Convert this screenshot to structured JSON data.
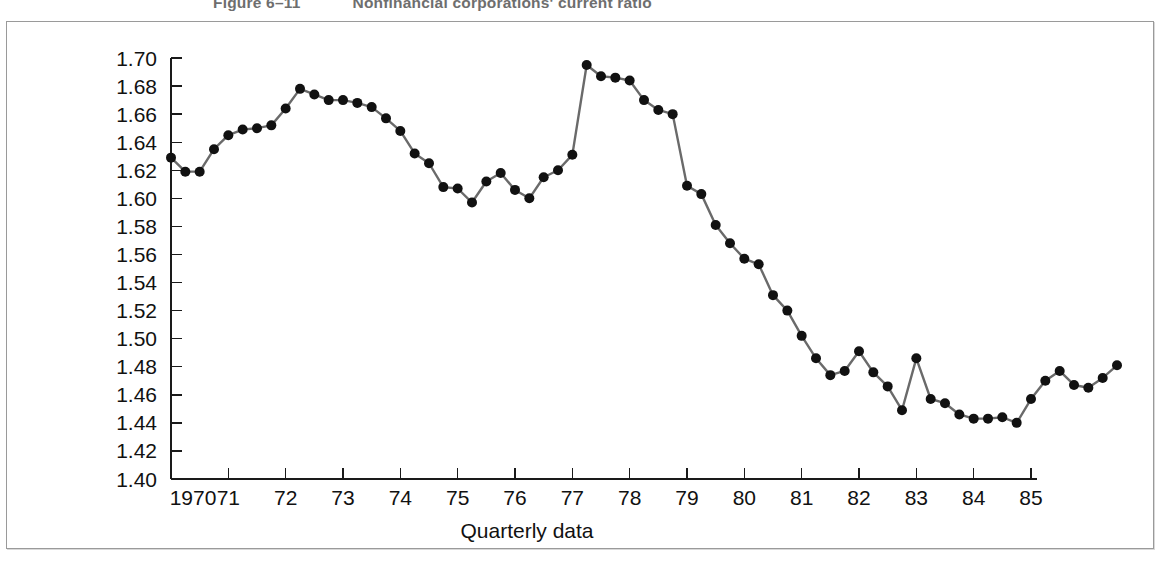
{
  "caption": {
    "figure_number": "Figure 6–11",
    "figure_title": "Nonfinancial corporations' current ratio"
  },
  "axes": {
    "x_axis_title": "Quarterly data",
    "y_axis_title": "",
    "y_ticks": [
      "1.70",
      "1.68",
      "1.66",
      "1.64",
      "1.62",
      "1.60",
      "1.58",
      "1.56",
      "1.54",
      "1.52",
      "1.50",
      "1.48",
      "1.46",
      "1.44",
      "1.42",
      "1.40"
    ],
    "x_ticks": [
      "1970",
      "71",
      "72",
      "73",
      "74",
      "75",
      "76",
      "77",
      "78",
      "79",
      "80",
      "81",
      "82",
      "83",
      "84",
      "85"
    ]
  },
  "colors": {
    "line": "#6a6a6a",
    "marker": "#111111",
    "axis": "#1a1a1a",
    "frame": "#9a9a9a",
    "caption": "#6e6e6e",
    "background": "#ffffff"
  },
  "chart_data": {
    "type": "line",
    "title": "Nonfinancial corporations' current ratio",
    "xlabel": "Quarterly data",
    "ylabel": "",
    "xlim": [
      1970.0,
      1985.5
    ],
    "ylim": [
      1.4,
      1.7
    ],
    "ytick_step": 0.02,
    "grid": false,
    "legend": "none",
    "marker": "filled-circle",
    "categories": [
      "1970.0",
      "1970.25",
      "1970.5",
      "1970.75",
      "1971.0",
      "1971.25",
      "1971.5",
      "1971.75",
      "1972.0",
      "1972.25",
      "1972.5",
      "1972.75",
      "1973.0",
      "1973.25",
      "1973.5",
      "1973.75",
      "1974.0",
      "1974.25",
      "1974.5",
      "1974.75",
      "1975.0",
      "1975.25",
      "1975.5",
      "1975.75",
      "1976.0",
      "1976.25",
      "1976.5",
      "1976.75",
      "1977.0",
      "1977.25",
      "1977.5",
      "1977.75",
      "1978.0",
      "1978.25",
      "1978.5",
      "1978.75",
      "1979.0",
      "1979.25",
      "1979.5",
      "1979.75",
      "1980.0",
      "1980.25",
      "1980.5",
      "1980.75",
      "1981.0",
      "1981.25",
      "1981.5",
      "1981.75",
      "1982.0",
      "1982.25",
      "1982.5",
      "1982.75",
      "1983.0",
      "1983.25",
      "1983.5",
      "1983.75",
      "1984.0",
      "1984.25",
      "1984.5",
      "1984.75",
      "1985.0",
      "1985.25",
      "1985.5"
    ],
    "x": [
      1970.0,
      1970.25,
      1970.5,
      1970.75,
      1971.0,
      1971.25,
      1971.5,
      1971.75,
      1972.0,
      1972.25,
      1972.5,
      1972.75,
      1973.0,
      1973.25,
      1973.5,
      1973.75,
      1974.0,
      1974.25,
      1974.5,
      1974.75,
      1975.0,
      1975.25,
      1975.5,
      1975.75,
      1976.0,
      1976.25,
      1976.5,
      1976.75,
      1977.0,
      1977.25,
      1977.5,
      1977.75,
      1978.0,
      1978.25,
      1978.5,
      1978.75,
      1979.0,
      1979.25,
      1979.5,
      1979.75,
      1980.0,
      1980.25,
      1980.5,
      1980.75,
      1981.0,
      1981.25,
      1981.5,
      1981.75,
      1982.0,
      1982.25,
      1982.5,
      1982.75,
      1983.0,
      1983.25,
      1983.5,
      1983.75,
      1984.0,
      1984.25,
      1984.5,
      1984.75,
      1985.0,
      1985.25,
      1985.5
    ],
    "values": [
      1.629,
      1.619,
      1.619,
      1.635,
      1.645,
      1.649,
      1.65,
      1.652,
      1.664,
      1.678,
      1.674,
      1.67,
      1.67,
      1.668,
      1.665,
      1.657,
      1.648,
      1.632,
      1.625,
      1.608,
      1.607,
      1.597,
      1.612,
      1.618,
      1.606,
      1.6,
      1.615,
      1.62,
      1.631,
      1.695,
      1.687,
      1.686,
      1.684,
      1.67,
      1.663,
      1.66,
      1.609,
      1.603,
      1.581,
      1.568,
      1.557,
      1.553,
      1.531,
      1.52,
      1.502,
      1.486,
      1.474,
      1.477,
      1.491,
      1.476,
      1.466,
      1.449,
      1.486,
      1.457,
      1.454,
      1.446,
      1.443,
      1.443,
      1.444,
      1.44,
      1.457,
      1.47,
      1.477
    ],
    "series": [
      {
        "name": "Nonfinancial corporations' current ratio",
        "values": [
          1.629,
          1.619,
          1.619,
          1.635,
          1.645,
          1.649,
          1.65,
          1.652,
          1.664,
          1.678,
          1.674,
          1.67,
          1.67,
          1.668,
          1.665,
          1.657,
          1.648,
          1.632,
          1.625,
          1.608,
          1.607,
          1.597,
          1.612,
          1.618,
          1.606,
          1.6,
          1.615,
          1.62,
          1.631,
          1.695,
          1.687,
          1.686,
          1.684,
          1.67,
          1.663,
          1.66,
          1.609,
          1.603,
          1.581,
          1.568,
          1.557,
          1.553,
          1.531,
          1.52,
          1.502,
          1.486,
          1.474,
          1.477,
          1.491,
          1.476,
          1.466,
          1.449,
          1.486,
          1.457,
          1.454,
          1.446,
          1.443,
          1.443,
          1.444,
          1.44,
          1.457,
          1.47,
          1.477
        ]
      }
    ],
    "extra_tail": {
      "x": [
        1985.75,
        1986.0,
        1986.25,
        1986.5
      ],
      "values": [
        1.48,
        1.467,
        1.465,
        1.472,
        1.481
      ]
    }
  }
}
